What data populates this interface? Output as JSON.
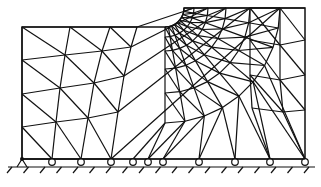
{
  "diagram": {
    "title": "",
    "colors": {
      "line": "#111111",
      "background": "#ffffff"
    },
    "domain": {
      "left": 22,
      "right": 305,
      "bottom": 159,
      "top_left_y": 27,
      "top_right_y": 8,
      "notch": {
        "cx": 165,
        "cy": 8,
        "r": 19
      }
    },
    "supports": {
      "pin": {
        "x": 22,
        "y": 159
      },
      "rollers_x": [
        52,
        81,
        111,
        133,
        148,
        163,
        199,
        235,
        270,
        305
      ],
      "roller_y": 162,
      "ground_y": 167
    },
    "labels": []
  }
}
